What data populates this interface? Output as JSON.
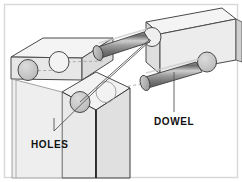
{
  "figure": {
    "background_color": "#ffffff",
    "border_color": "#d8d8d8"
  },
  "labels": {
    "holes": "HOLES",
    "dowel": "DOWEL"
  },
  "palette": {
    "board_top_face": "#f2f2f2",
    "board_front_face": "#e4e4e4",
    "board_side_face": "#d4d4d4",
    "board_outline": "#4a4a4a",
    "board_outline_dark": "#222222",
    "hidden_line": "#8d8d8d",
    "hole_fill": "#c9c9c9",
    "hole_outline": "#4a4a4a",
    "dowel_dark": "#6f6f6f",
    "dowel_mid": "#9a9a9a",
    "dowel_light": "#cfcfcf",
    "dowel_end_cap": "#b3b3b3",
    "leader_line": "#555555",
    "label_text": "#111111"
  },
  "parts": {
    "vertical_board": "front upright board",
    "right_board": "horizontal right board",
    "left_board": "horizontal left board",
    "dowels": [
      "upper dowel",
      "lower dowel"
    ],
    "hole_count": 4
  }
}
